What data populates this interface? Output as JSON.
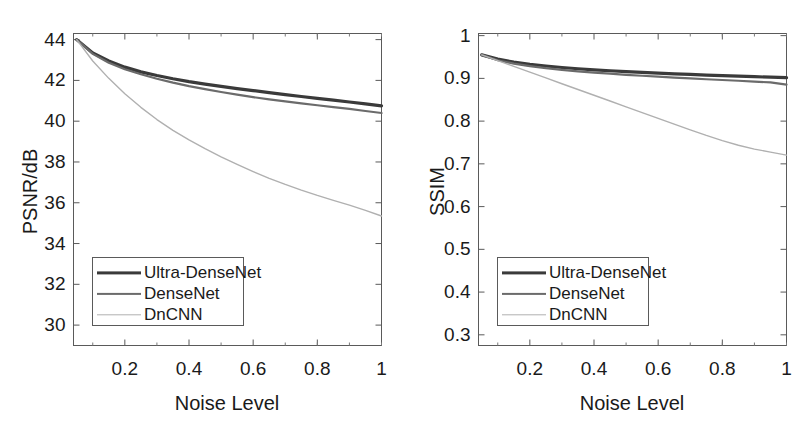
{
  "figure": {
    "background": "#ffffff",
    "panels": [
      "psnr",
      "ssim"
    ]
  },
  "series_style": {
    "ultra": {
      "color": "#3a3a3a",
      "width": 3.2,
      "name": "Ultra-DenseNet"
    },
    "dense": {
      "color": "#6b6b6b",
      "width": 2.2,
      "name": "DenseNet"
    },
    "dncnn": {
      "color": "#b0b0b0",
      "width": 1.4,
      "name": "DnCNN"
    }
  },
  "legend": {
    "items": [
      {
        "label": "Ultra-DenseNet",
        "color": "#3a3a3a",
        "width": 3.2
      },
      {
        "label": "DenseNet",
        "color": "#6b6b6b",
        "width": 2.2
      },
      {
        "label": "DnCNN",
        "color": "#b0b0b0",
        "width": 1.4
      }
    ]
  },
  "chart_data": [
    {
      "type": "line",
      "id": "psnr",
      "title": "",
      "xlabel": "Noise Level",
      "ylabel": "PSNR/dB",
      "xlim": [
        0.04,
        1.0
      ],
      "ylim": [
        29.0,
        44.3
      ],
      "xticks": [
        0.2,
        0.4,
        0.6,
        0.8,
        1
      ],
      "xticklabels": [
        "0.2",
        "0.4",
        "0.6",
        "0.8",
        "1"
      ],
      "yticks": [
        30,
        32,
        34,
        36,
        38,
        40,
        42,
        44
      ],
      "yticklabels": [
        "30",
        "32",
        "34",
        "36",
        "38",
        "40",
        "42",
        "44"
      ],
      "grid": false,
      "legend_position": "lower left",
      "x": [
        0.05,
        0.1,
        0.15,
        0.2,
        0.25,
        0.3,
        0.35,
        0.4,
        0.45,
        0.5,
        0.55,
        0.6,
        0.65,
        0.7,
        0.75,
        0.8,
        0.85,
        0.9,
        0.95,
        1.0
      ],
      "series": [
        {
          "name": "Ultra-DenseNet",
          "values": [
            44.0,
            43.35,
            42.95,
            42.65,
            42.42,
            42.24,
            42.08,
            41.94,
            41.82,
            41.71,
            41.6,
            41.5,
            41.4,
            41.3,
            41.21,
            41.12,
            41.03,
            40.94,
            40.85,
            40.75
          ]
        },
        {
          "name": "DenseNet",
          "values": [
            44.0,
            43.3,
            42.87,
            42.55,
            42.3,
            42.08,
            41.89,
            41.72,
            41.57,
            41.43,
            41.3,
            41.18,
            41.07,
            40.97,
            40.87,
            40.78,
            40.69,
            40.6,
            40.5,
            40.4
          ]
        },
        {
          "name": "DnCNN",
          "values": [
            44.0,
            42.95,
            42.1,
            41.35,
            40.68,
            40.08,
            39.55,
            39.08,
            38.65,
            38.25,
            37.88,
            37.53,
            37.2,
            36.9,
            36.62,
            36.36,
            36.12,
            35.88,
            35.63,
            35.35
          ]
        }
      ]
    },
    {
      "type": "line",
      "id": "ssim",
      "title": "",
      "xlabel": "Noise Level",
      "ylabel": "SSIM",
      "xlim": [
        0.04,
        1.0
      ],
      "ylim": [
        0.275,
        1.005
      ],
      "xticks": [
        0.2,
        0.4,
        0.6,
        0.8,
        1
      ],
      "xticklabels": [
        "0.2",
        "0.4",
        "0.6",
        "0.8",
        "1"
      ],
      "yticks": [
        0.3,
        0.4,
        0.5,
        0.6,
        0.7,
        0.8,
        0.9,
        1
      ],
      "yticklabels": [
        "0.3",
        "0.4",
        "0.5",
        "0.6",
        "0.7",
        "0.8",
        "0.9",
        "1"
      ],
      "grid": false,
      "legend_position": "lower left",
      "x": [
        0.05,
        0.1,
        0.15,
        0.2,
        0.25,
        0.3,
        0.35,
        0.4,
        0.45,
        0.5,
        0.55,
        0.6,
        0.65,
        0.7,
        0.75,
        0.8,
        0.85,
        0.9,
        0.95,
        1.0
      ],
      "series": [
        {
          "name": "Ultra-DenseNet",
          "values": [
            0.955,
            0.945,
            0.938,
            0.933,
            0.929,
            0.9255,
            0.9225,
            0.92,
            0.9178,
            0.9158,
            0.914,
            0.9123,
            0.9107,
            0.9092,
            0.9078,
            0.9064,
            0.9051,
            0.9039,
            0.9028,
            0.9018
          ]
        },
        {
          "name": "DenseNet",
          "values": [
            0.955,
            0.9425,
            0.9345,
            0.9285,
            0.9238,
            0.92,
            0.9166,
            0.9136,
            0.9109,
            0.9084,
            0.9061,
            0.9039,
            0.9018,
            0.8998,
            0.898,
            0.8962,
            0.8944,
            0.8925,
            0.8905,
            0.8855
          ]
        },
        {
          "name": "DnCNN",
          "values": [
            0.955,
            0.9415,
            0.928,
            0.9145,
            0.901,
            0.8875,
            0.874,
            0.8605,
            0.847,
            0.8335,
            0.82,
            0.8065,
            0.793,
            0.7795,
            0.7665,
            0.7545,
            0.7435,
            0.7345,
            0.7275,
            0.7205
          ]
        }
      ]
    }
  ]
}
